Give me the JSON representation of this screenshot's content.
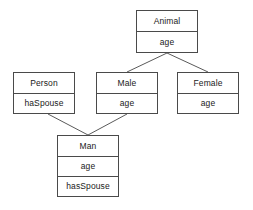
{
  "diagram": {
    "type": "uml-class-diagram",
    "background_color": "#ffffff",
    "border_color": "#4a4a4a",
    "text_color": "#1a1a1a",
    "edge_color": "#5a5a5a"
  },
  "classes": [
    {
      "id": "animal",
      "name": "Animal",
      "attributes": [
        "age"
      ],
      "x": 136,
      "y": 10,
      "width": 62,
      "height": 43
    },
    {
      "id": "person",
      "name": "Person",
      "attributes": [
        "haSpouse"
      ],
      "x": 13,
      "y": 72,
      "width": 62,
      "height": 42
    },
    {
      "id": "male",
      "name": "Male",
      "attributes": [
        "age"
      ],
      "x": 96,
      "y": 72,
      "width": 62,
      "height": 42
    },
    {
      "id": "female",
      "name": "Female",
      "attributes": [
        "age"
      ],
      "x": 177,
      "y": 72,
      "width": 62,
      "height": 42
    },
    {
      "id": "man",
      "name": "Man",
      "attributes": [
        "age",
        "hasSpouse"
      ],
      "x": 57,
      "y": 135,
      "width": 62,
      "height": 62
    }
  ],
  "edges": [
    {
      "id": "animal-male",
      "from": "animal",
      "to": "male",
      "x1": 167,
      "y1": 53,
      "x2": 127,
      "y2": 72
    },
    {
      "id": "animal-female",
      "from": "animal",
      "to": "female",
      "x1": 167,
      "y1": 53,
      "x2": 208,
      "y2": 72
    },
    {
      "id": "person-man",
      "from": "person",
      "to": "man",
      "x1": 48,
      "y1": 114,
      "x2": 88,
      "y2": 135
    },
    {
      "id": "male-man",
      "from": "male",
      "to": "man",
      "x1": 127,
      "y1": 114,
      "x2": 88,
      "y2": 135
    }
  ]
}
